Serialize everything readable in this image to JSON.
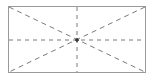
{
  "diagram": {
    "type": "placeholder-rectangle",
    "colors": {
      "border": "#9a9a9a",
      "dash": "#7a7a7a",
      "center_mark": "#333333",
      "background": "#ffffff"
    },
    "rect": {
      "x": 8,
      "y": 6,
      "width": 138,
      "height": 67
    },
    "center": {
      "x": 77,
      "y": 40
    }
  }
}
